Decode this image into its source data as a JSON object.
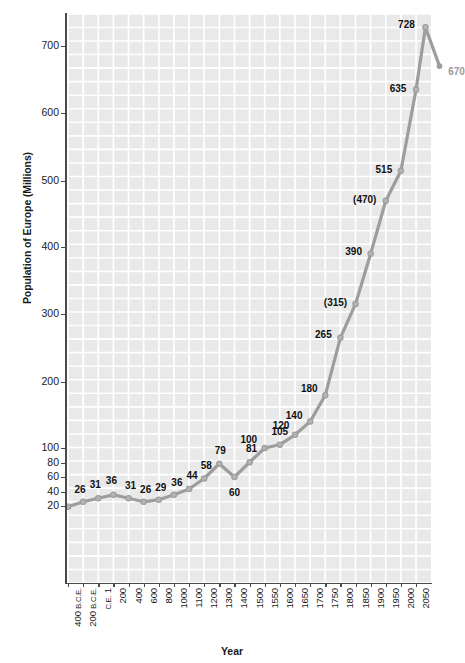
{
  "chart_data": {
    "type": "line",
    "title": "",
    "xlabel": "Year",
    "ylabel": "Population of Europe (Millions)",
    "grid": true,
    "legend": "none",
    "y_axis_scale": "piecewise (compressed below 100)",
    "ylim": [
      20,
      740
    ],
    "y_ticks": [
      20,
      40,
      60,
      80,
      100,
      200,
      300,
      400,
      500,
      600,
      700
    ],
    "y_tick_labels": [
      "20",
      "40",
      "60",
      "80",
      "100",
      "200",
      "300",
      "400",
      "500",
      "600",
      "700"
    ],
    "categories": [
      "400 B.C.E.",
      "200 B.C.E.",
      "C.E. 1",
      "200",
      "400",
      "600",
      "800",
      "1000",
      "1100",
      "1200",
      "1300",
      "1400",
      "1500",
      "1550",
      "1600",
      "1650",
      "1700",
      "1750",
      "1800",
      "1850",
      "1900",
      "1950",
      "2000",
      "2050"
    ],
    "values": [
      19,
      26,
      31,
      36,
      31,
      26,
      29,
      36,
      44,
      58,
      79,
      60,
      81,
      100,
      105,
      120,
      140,
      180,
      265,
      315,
      390,
      470,
      515,
      635
    ],
    "point_labels": [
      "",
      "26",
      "31",
      "36",
      "31",
      "26",
      "29",
      "36",
      "44",
      "58",
      "79",
      "60",
      "81",
      "100",
      "105",
      "120",
      "140",
      "180",
      "265",
      "(315)",
      "390",
      "(470)",
      "515",
      "635"
    ],
    "extra_points": [
      {
        "label": "728",
        "value": 728,
        "projected": false
      },
      {
        "label": "670",
        "value": 670,
        "projected": true
      }
    ],
    "annotations": [
      "Values shown in parentheses are interpolated estimates.",
      "The final gray point (670) is a projection."
    ],
    "colors": {
      "line": "#9d9d9d",
      "marker": "#b4b4b4",
      "plot_background": "#e9e9e9",
      "gridline": "#ffffff",
      "axis": "#4a4a4a",
      "label_text": "#111111",
      "projected_text": "#9a9a9a"
    }
  },
  "axis": {
    "x_title": "Year",
    "y_title": "Population of Europe (Millions)"
  }
}
